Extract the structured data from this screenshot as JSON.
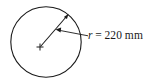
{
  "figure": {
    "type": "geometry-diagram",
    "background_color": "#ffffff",
    "stroke_color": "#1a1a1a",
    "circle": {
      "center_x": 46,
      "center_y": 42,
      "radius_px": 35.5
    },
    "radius_arrow": {
      "from_x": 46,
      "from_y": 42,
      "to_x": 68,
      "to_y": 15,
      "arrowhead": "at-circle-edge"
    },
    "leader_arrow": {
      "from_x": 88,
      "from_y": 36,
      "to_x": 56,
      "to_y": 30,
      "arrowhead": "left-pointing"
    },
    "center_mark": {
      "x": 40,
      "y": 47,
      "glyph": "cross-tick"
    },
    "label": {
      "variable": "r",
      "equals": "=",
      "value": "220",
      "unit": "mm",
      "full_text": "r = 220 mm",
      "x": 88,
      "y": 30
    }
  }
}
